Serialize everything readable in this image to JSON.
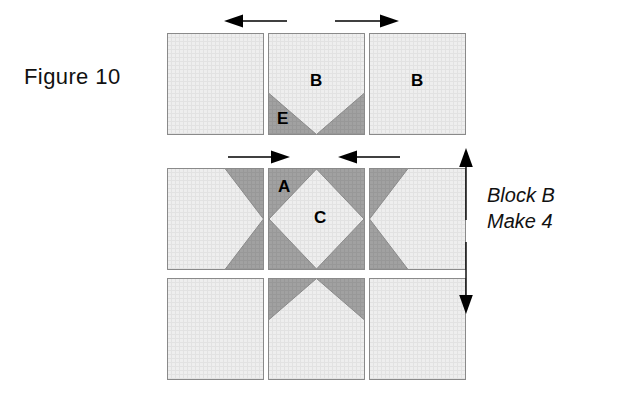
{
  "figure": {
    "label": "Figure 10",
    "caption_line1": "Block B",
    "caption_line2": "Make 4"
  },
  "colors": {
    "light_fabric": "#ececec",
    "light_fabric_grid": "#e0e0e0",
    "dark_fabric": "#9e9e9e",
    "dark_fabric_grid": "#969696",
    "outline": "#8a8a8a",
    "arrow": "#000000",
    "text": "#111111",
    "background": "#ffffff"
  },
  "patch_labels": {
    "b_center": "B",
    "b_right": "B",
    "e": "E",
    "a": "A",
    "c": "C"
  },
  "rows": [
    {
      "name": "top-row",
      "blocks": [
        {
          "name": "plain-light-square",
          "label": ""
        },
        {
          "name": "flying-geese-down",
          "labels": [
            "B",
            "E"
          ]
        },
        {
          "name": "plain-light-square",
          "label": "B"
        }
      ]
    },
    {
      "name": "middle-row",
      "blocks": [
        {
          "name": "flying-geese-right",
          "label": ""
        },
        {
          "name": "square-in-a-square",
          "labels": [
            "A",
            "C"
          ]
        },
        {
          "name": "flying-geese-left",
          "label": ""
        }
      ]
    },
    {
      "name": "bottom-row",
      "blocks": [
        {
          "name": "plain-light-square",
          "label": ""
        },
        {
          "name": "flying-geese-up",
          "label": ""
        },
        {
          "name": "plain-light-square",
          "label": ""
        }
      ]
    }
  ],
  "arrows": [
    {
      "name": "top-left-arrow",
      "direction": "left"
    },
    {
      "name": "top-right-arrow",
      "direction": "right"
    },
    {
      "name": "middle-left-arrow",
      "direction": "right"
    },
    {
      "name": "middle-right-arrow",
      "direction": "left"
    },
    {
      "name": "vertical-double-arrow",
      "direction": "up-down"
    }
  ]
}
